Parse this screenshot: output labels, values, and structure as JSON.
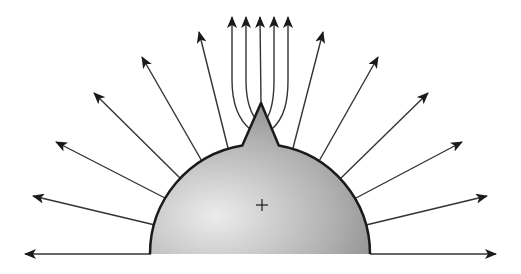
{
  "figure": {
    "colors": {
      "background": "#ffffff",
      "stroke": "#1a1a1a",
      "ray": "#333333",
      "fill_light": "#e6e6e6",
      "fill_dark": "#8a8a8a"
    },
    "dome": {
      "cx": 260,
      "cy": 254,
      "r": 110
    },
    "spike": {
      "tip": [
        261,
        103
      ],
      "base_left": [
        243,
        150
      ],
      "base_right": [
        278,
        150
      ]
    },
    "center_mark": {
      "x": 262,
      "y": 205,
      "symbol": "+"
    },
    "baseline_y": 254,
    "radial_rays": [
      {
        "from": [
          151,
          254
        ],
        "to": [
          25,
          254
        ]
      },
      {
        "from": [
          155,
          225
        ],
        "to": [
          33,
          196
        ]
      },
      {
        "from": [
          165,
          198
        ],
        "to": [
          56,
          142
        ]
      },
      {
        "from": [
          181,
          179
        ],
        "to": [
          94,
          93
        ]
      },
      {
        "from": [
          203,
          163
        ],
        "to": [
          142,
          57
        ]
      },
      {
        "from": [
          229,
          152
        ],
        "to": [
          199,
          32
        ]
      },
      {
        "from": [
          292,
          152
        ],
        "to": [
          323,
          32
        ]
      },
      {
        "from": [
          318,
          163
        ],
        "to": [
          378,
          57
        ]
      },
      {
        "from": [
          340,
          179
        ],
        "to": [
          428,
          93
        ]
      },
      {
        "from": [
          356,
          198
        ],
        "to": [
          462,
          142
        ]
      },
      {
        "from": [
          366,
          225
        ],
        "to": [
          487,
          196
        ]
      },
      {
        "from": [
          370,
          254
        ],
        "to": [
          496,
          254
        ]
      }
    ],
    "tip_rays": [
      {
        "path": "M 251 130 C 236 118, 232 100, 232 80 L 232 17",
        "tip": [
          232,
          17
        ]
      },
      {
        "path": "M 255 118 C 248 108, 246 95, 246 80 L 246 17",
        "tip": [
          246,
          17
        ]
      },
      {
        "path": "M 261 103 L 260 17",
        "tip": [
          260,
          17
        ]
      },
      {
        "path": "M 267 118 C 273 108, 274 95, 274 80 L 274 17",
        "tip": [
          274,
          17
        ]
      },
      {
        "path": "M 271 130 C 285 118, 288 100, 288 80 L 288 17",
        "tip": [
          288,
          17
        ]
      }
    ]
  }
}
